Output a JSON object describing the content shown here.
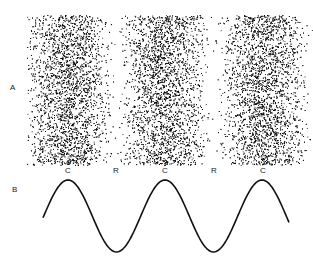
{
  "panels": {
    "a": {
      "label": "A"
    },
    "b": {
      "label": "B"
    }
  },
  "band_labels": [
    {
      "text": "C",
      "x": 68
    },
    {
      "text": "R",
      "x": 116
    },
    {
      "text": "C",
      "x": 165
    },
    {
      "text": "R",
      "x": 214
    },
    {
      "text": "C",
      "x": 263
    }
  ],
  "stipple": {
    "band_centers_x": [
      68,
      165,
      263
    ],
    "top": 15,
    "bottom": 165,
    "left": 27,
    "right": 313,
    "color": "#000000"
  },
  "wave": {
    "start_x": 43,
    "end_x": 289,
    "peak_y": 180,
    "trough_y": 252,
    "peaks_x": [
      68,
      165,
      263
    ],
    "troughs_x": [
      116,
      214
    ],
    "stroke": "#111111"
  }
}
